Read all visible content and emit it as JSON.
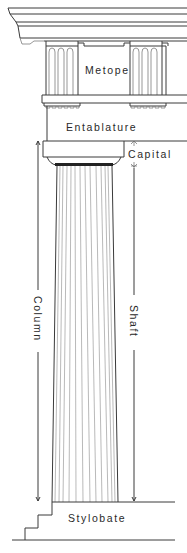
{
  "diagram": {
    "labels": {
      "metope": "Metope",
      "entablature": "Entablature",
      "capital": "Capital",
      "column": "Column",
      "shaft": "Shaft",
      "stylobate": "Stylobate"
    },
    "colors": {
      "line": "#3a3a3a",
      "text": "#2a2a2a",
      "background": "#ffffff"
    }
  }
}
